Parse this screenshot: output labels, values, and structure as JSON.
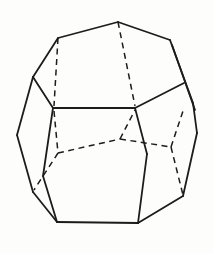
{
  "figure": {
    "name": "polyhedron-wireframe-drawing",
    "canvas": {
      "width": 213,
      "height": 254,
      "background": "#fdfdfb",
      "stroke_color": "#1c1c1c",
      "solid_stroke_width": 1.8,
      "dashed_stroke_width": 1.5,
      "dash_pattern": "6 4.5"
    },
    "solid_edges": [
      [
        58,
        38,
        118,
        22
      ],
      [
        118,
        22,
        170,
        40
      ],
      [
        58,
        38,
        33,
        77
      ],
      [
        33,
        77,
        53,
        108
      ],
      [
        53,
        108,
        135,
        108
      ],
      [
        33,
        77,
        17,
        135
      ],
      [
        17,
        135,
        33,
        192
      ],
      [
        33,
        192,
        57,
        222
      ],
      [
        57,
        222,
        138,
        223
      ],
      [
        53,
        108,
        43,
        176
      ],
      [
        43,
        176,
        57,
        222
      ],
      [
        135,
        108,
        147,
        154
      ],
      [
        147,
        154,
        138,
        223
      ],
      [
        138,
        223,
        183,
        196
      ],
      [
        183,
        196,
        197,
        133
      ],
      [
        197,
        133,
        193,
        103
      ],
      [
        193,
        103,
        170,
        40
      ],
      [
        172,
        45,
        195,
        110
      ],
      [
        135,
        108,
        184,
        83
      ]
    ],
    "dashed_edges": [
      [
        118,
        22,
        135,
        106
      ],
      [
        58,
        38,
        54,
        106
      ],
      [
        54,
        111,
        58,
        153
      ],
      [
        58,
        153,
        34,
        190
      ],
      [
        58,
        153,
        120,
        139
      ],
      [
        120,
        139,
        135,
        110
      ],
      [
        120,
        139,
        171,
        147
      ],
      [
        171,
        147,
        183,
        195
      ],
      [
        171,
        147,
        184,
        108
      ]
    ]
  }
}
